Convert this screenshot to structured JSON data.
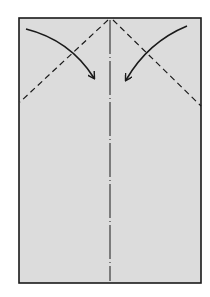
{
  "diagram": {
    "type": "origami-fold-instruction",
    "paper": {
      "fill": "#dcdcdc",
      "stroke": "#1a1a1a",
      "x": 19,
      "y": 18,
      "width": 182,
      "height": 265
    },
    "center_crease": {
      "style": "dash-dot",
      "x": 110
    },
    "valley_folds": [
      {
        "name": "left-diagonal",
        "from": [
          108,
          20
        ],
        "to": [
          20,
          102
        ]
      },
      {
        "name": "right-diagonal",
        "from": [
          113,
          20
        ],
        "to": [
          201,
          106
        ]
      }
    ],
    "arrows": [
      {
        "name": "left-fold-arrow",
        "direction": "down-right"
      },
      {
        "name": "right-fold-arrow",
        "direction": "down-left"
      }
    ],
    "colors": {
      "paper": "#dcdcdc",
      "line": "#1a1a1a",
      "background": "#ffffff"
    }
  }
}
